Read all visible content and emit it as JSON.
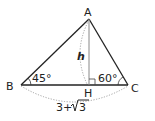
{
  "diagram": {
    "type": "triangle-geometry",
    "vertices": {
      "A": {
        "label": "A"
      },
      "B": {
        "label": "B"
      },
      "C": {
        "label": "C"
      },
      "H": {
        "label": "H"
      }
    },
    "angles": {
      "B": "45°",
      "C": "60°"
    },
    "altitude_label": "h",
    "base_length_label": "3+√3",
    "base_prefix": "3+",
    "base_radicand": "3",
    "right_angle_at": "H",
    "colors": {
      "line": "#222222",
      "altitude": "#888888",
      "dotted": "#999999"
    }
  }
}
